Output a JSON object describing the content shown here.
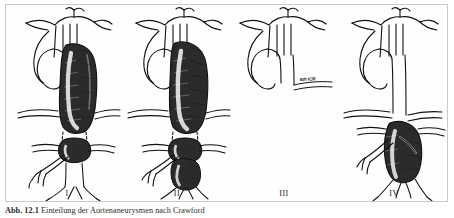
{
  "figure": {
    "frame_border_color": "#c9c9c9",
    "background_color": "#ffffff",
    "ink_color": "#111111",
    "top_bleed_text": "",
    "panels": [
      {
        "numeral": "I",
        "name": "crawford-type-1",
        "description": "Aneurysm of descending thoracic aorta from left subclavian artery to above the renal arteries",
        "annotation": ""
      },
      {
        "numeral": "II",
        "name": "crawford-type-2",
        "description": "Aneurysm from left subclavian artery to below the renal arteries, extending into the infrarenal aorta",
        "annotation": ""
      },
      {
        "numeral": "III",
        "name": "crawford-type-3",
        "description": "Aneurysm from the 6th intercostal space distally to the aortic bifurcation",
        "annotation": "6th ICR"
      },
      {
        "numeral": "IV",
        "name": "crawford-type-4",
        "description": "Aneurysm limited to the abdominal aorta, from the diaphragm to the aortic bifurcation",
        "annotation": ""
      }
    ]
  },
  "caption": {
    "number": "Abb. 12.1",
    "text": "Einteilung der Aortenaneurysmen nach Crawford"
  }
}
